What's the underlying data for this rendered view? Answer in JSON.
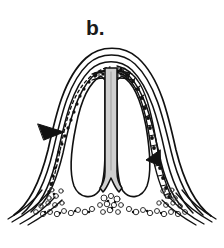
{
  "figure": {
    "panel_label": "b.",
    "caption_text": "",
    "background_color": "#ffffff",
    "ink_color": "#111111",
    "column_fill_color": "#cfcfcf",
    "cell_mass_color": "#555555"
  },
  "illustration": {
    "name": "histological-cross-section",
    "description": "Line drawing of a dome-shaped cross section with concentric tissue layers, a central gray column, two lateral cavities and a vacuolated cell mass at the base",
    "parts": [
      {
        "id": "outer-contour",
        "label": "outer contour layer"
      },
      {
        "id": "second-contour",
        "label": "second contour layer"
      },
      {
        "id": "third-contour",
        "label": "third contour layer"
      },
      {
        "id": "inner-contour",
        "label": "inner contour layer"
      },
      {
        "id": "epithelial-band-left",
        "label": "left stippled epithelial band"
      },
      {
        "id": "epithelial-band-right",
        "label": "right stippled epithelial band"
      },
      {
        "id": "central-column",
        "label": "central gray column"
      },
      {
        "id": "left-cavity",
        "label": "left lobe cavity"
      },
      {
        "id": "right-cavity",
        "label": "right lobe cavity"
      },
      {
        "id": "basal-cell-mass",
        "label": "basal vacuolated cell mass"
      },
      {
        "id": "flare-lines-left",
        "label": "left basal flare lines"
      },
      {
        "id": "flare-lines-right",
        "label": "right basal flare lines"
      },
      {
        "id": "arrow-left",
        "label": "left arrowhead marker"
      },
      {
        "id": "arrow-right",
        "label": "right arrowhead marker"
      }
    ]
  }
}
